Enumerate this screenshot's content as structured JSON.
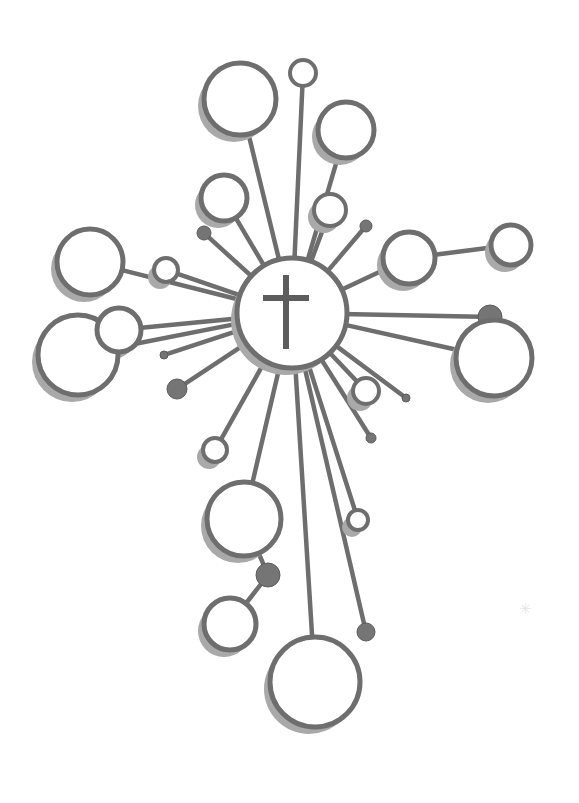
{
  "artwork": {
    "title": "Radiant Cross Emblem",
    "description": "Stylized cross formed by spokes radiating from a central medallion, each spoke terminating in an outlined circle or filled dot.",
    "canvas": {
      "width": 579,
      "height": 803,
      "background": "#ffffff"
    },
    "palette": {
      "stroke": "#6e6e6e",
      "stroke_dark": "#5c5c5c",
      "shadow": "#a9a9a9",
      "fill": "#ffffff",
      "dot_fill": "#757575",
      "speck": "#8e8e8e"
    },
    "stroke_widths": {
      "spoke": 4.5,
      "ring": 5,
      "ring_small": 4,
      "cross": 6
    },
    "shadow_offset": {
      "dx": -6,
      "dy": 7
    },
    "hub": {
      "label": "central-medallion",
      "cx": 292,
      "cy": 313,
      "r": 55,
      "shadow_dx": -6,
      "shadow_dy": 7,
      "symbol": "latin-cross",
      "cross": {
        "cx": 286,
        "cy": 312,
        "height": 74,
        "width": 46,
        "arm_y": 298
      }
    },
    "nodes": [
      {
        "name": "node-top-left-large",
        "cx": 240,
        "cy": 99,
        "r": 36,
        "kind": "ring",
        "shadow": true,
        "from_r": 55
      },
      {
        "name": "node-top-tiny",
        "cx": 303,
        "cy": 73,
        "r": 13,
        "kind": "ring",
        "shadow": false,
        "from_r": 55
      },
      {
        "name": "node-top-right-medium",
        "cx": 346,
        "cy": 130,
        "r": 28,
        "kind": "ring",
        "shadow": true,
        "from_r": 55
      },
      {
        "name": "node-upper-left-small",
        "cx": 224,
        "cy": 198,
        "r": 23,
        "kind": "ring",
        "shadow": true,
        "from_r": 55
      },
      {
        "name": "node-upper-right-small",
        "cx": 330,
        "cy": 210,
        "r": 16,
        "kind": "ring",
        "shadow": true,
        "from_r": 55
      },
      {
        "name": "node-upper-right-dot",
        "cx": 366,
        "cy": 226,
        "r": 6,
        "kind": "dot",
        "shadow": false,
        "from_r": 55
      },
      {
        "name": "node-left-upper-dot",
        "cx": 204,
        "cy": 233,
        "r": 7,
        "kind": "dot",
        "shadow": false,
        "from_r": 55
      },
      {
        "name": "node-left-large",
        "cx": 90,
        "cy": 262,
        "r": 33,
        "kind": "ring",
        "shadow": true,
        "from_r": 55
      },
      {
        "name": "node-left-tiny",
        "cx": 166,
        "cy": 270,
        "r": 12,
        "kind": "ring",
        "shadow": true,
        "from_r": 55
      },
      {
        "name": "node-left-big-lower",
        "cx": 78,
        "cy": 355,
        "r": 40,
        "kind": "ring",
        "shadow": true,
        "from_r": 55
      },
      {
        "name": "node-left-mid-small",
        "cx": 119,
        "cy": 330,
        "r": 22,
        "kind": "ring",
        "shadow": true,
        "from_r": 55
      },
      {
        "name": "node-left-stub",
        "cx": 164,
        "cy": 355,
        "r": 4,
        "kind": "dot",
        "shadow": false,
        "from_r": 55
      },
      {
        "name": "node-left-lower-dot",
        "cx": 177,
        "cy": 389,
        "r": 10,
        "kind": "dot",
        "shadow": false,
        "from_r": 55
      },
      {
        "name": "node-left-lower-ring",
        "cx": 215,
        "cy": 450,
        "r": 12,
        "kind": "ring",
        "shadow": true,
        "from_r": 55
      },
      {
        "name": "node-right-medium",
        "cx": 409,
        "cy": 258,
        "r": 26,
        "kind": "ring",
        "shadow": true,
        "from_r": 55
      },
      {
        "name": "node-right-far-small",
        "cx": 511,
        "cy": 245,
        "r": 20,
        "kind": "ring",
        "shadow": true,
        "from_r": 55,
        "chain_from": "node-right-medium"
      },
      {
        "name": "node-right-dark-dot",
        "cx": 490,
        "cy": 317,
        "r": 12,
        "kind": "dot",
        "shadow": false,
        "from_r": 55
      },
      {
        "name": "node-right-big",
        "cx": 494,
        "cy": 358,
        "r": 38,
        "kind": "ring",
        "shadow": true,
        "from_r": 55
      },
      {
        "name": "node-lower-right-ring",
        "cx": 366,
        "cy": 391,
        "r": 13,
        "kind": "ring",
        "shadow": true,
        "from_r": 55
      },
      {
        "name": "node-lower-right-stub",
        "cx": 406,
        "cy": 398,
        "r": 4,
        "kind": "dot",
        "shadow": false,
        "from_r": 55
      },
      {
        "name": "node-lower-right-dot",
        "cx": 371,
        "cy": 438,
        "r": 5,
        "kind": "dot",
        "shadow": false,
        "from_r": 55
      },
      {
        "name": "node-bottom-ring-small",
        "cx": 358,
        "cy": 520,
        "r": 10,
        "kind": "ring",
        "shadow": true,
        "from_r": 55
      },
      {
        "name": "node-bottom-dot-right",
        "cx": 366,
        "cy": 632,
        "r": 9,
        "kind": "dot",
        "shadow": false,
        "from_r": 55
      },
      {
        "name": "node-bottom-left-large",
        "cx": 244,
        "cy": 519,
        "r": 37,
        "kind": "ring",
        "shadow": true,
        "from_r": 55
      },
      {
        "name": "node-bottom-mid-dot",
        "cx": 268,
        "cy": 575,
        "r": 12,
        "kind": "dot",
        "shadow": false,
        "chain_from": "node-bottom-left-large"
      },
      {
        "name": "node-bottom-small-ring",
        "cx": 230,
        "cy": 624,
        "r": 26,
        "kind": "ring",
        "shadow": true,
        "chain_from": "node-bottom-mid-dot"
      },
      {
        "name": "node-bottom-largest",
        "cx": 315,
        "cy": 682,
        "r": 45,
        "kind": "ring",
        "shadow": true,
        "from_r": 55
      }
    ],
    "speck": {
      "glyph": "✳",
      "x": 519,
      "y": 600
    }
  }
}
